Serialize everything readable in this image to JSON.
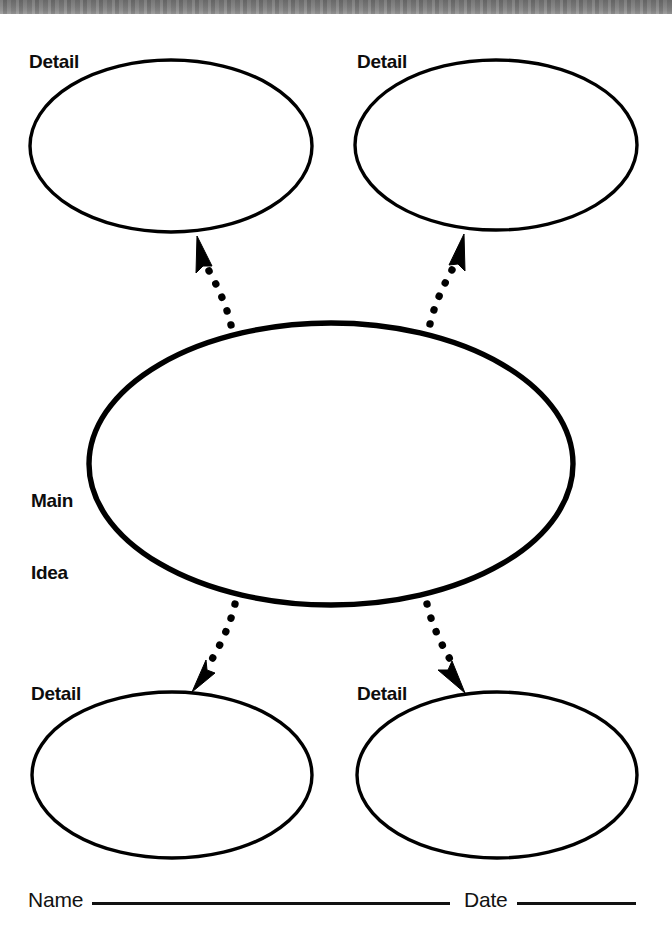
{
  "page": {
    "type": "graphic-organizer-worksheet",
    "background_color": "#ffffff",
    "ink_color": "#000000"
  },
  "scan_band": {
    "present": true,
    "color": "#7d7d7d",
    "height_px": 14
  },
  "center": {
    "label_line_1": "Main",
    "label_line_2": "Idea",
    "shape": "ellipse",
    "stroke_width_px": 5
  },
  "details": [
    {
      "id": "top-left",
      "label": "Detail",
      "shape": "ellipse",
      "stroke_width_px": 3
    },
    {
      "id": "top-right",
      "label": "Detail",
      "shape": "ellipse",
      "stroke_width_px": 3
    },
    {
      "id": "bottom-left",
      "label": "Detail",
      "shape": "ellipse",
      "stroke_width_px": 3
    },
    {
      "id": "bottom-right",
      "label": "Detail",
      "shape": "ellipse",
      "stroke_width_px": 3
    }
  ],
  "connectors": [
    {
      "id": "to-top-left",
      "style": "dotted-curve",
      "arrowhead": "solid-triangle",
      "direction": "up-left"
    },
    {
      "id": "to-top-right",
      "style": "dotted-curve",
      "arrowhead": "solid-triangle",
      "direction": "up-right"
    },
    {
      "id": "to-bottom-left",
      "style": "dotted-curve",
      "arrowhead": "solid-triangle",
      "direction": "down-left"
    },
    {
      "id": "to-bottom-right",
      "style": "dotted-curve",
      "arrowhead": "solid-triangle",
      "direction": "down-right"
    }
  ],
  "footer": {
    "name_label": "Name",
    "name_value": "",
    "name_placeholder": "",
    "date_label": "Date",
    "date_value": "",
    "date_placeholder": ""
  }
}
